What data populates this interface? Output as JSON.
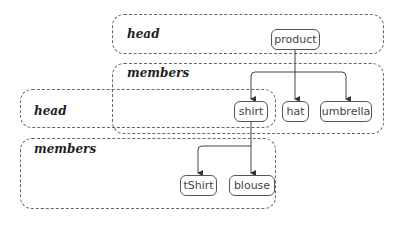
{
  "diagram": {
    "groups": {
      "top_head": {
        "label": "head"
      },
      "top_members": {
        "label": "members"
      },
      "sub_head": {
        "label": "head"
      },
      "sub_members": {
        "label": "members"
      }
    },
    "nodes": {
      "product": "product",
      "shirt": "shirt",
      "hat": "hat",
      "umbrella": "umbrella",
      "tshirt": "tShirt",
      "blouse": "blouse"
    },
    "edges": [
      {
        "from": "product",
        "to": "shirt"
      },
      {
        "from": "product",
        "to": "hat"
      },
      {
        "from": "product",
        "to": "umbrella"
      },
      {
        "from": "shirt",
        "to": "tShirt"
      },
      {
        "from": "shirt",
        "to": "blouse"
      }
    ],
    "colors": {
      "line": "#444444",
      "dash": "#666666",
      "background": "#ffffff"
    }
  }
}
